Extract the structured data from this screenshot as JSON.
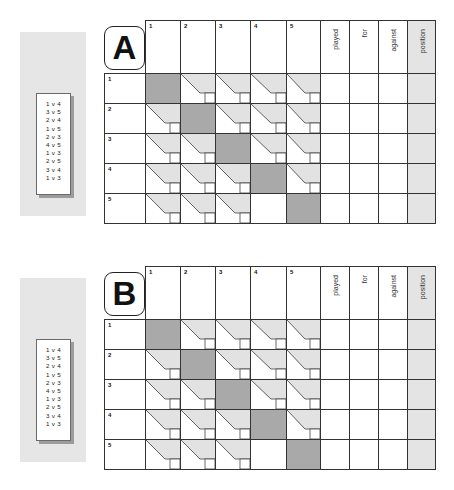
{
  "sheets": [
    {
      "label": "A",
      "fixtures": [
        "1 v 4",
        "3 v 5",
        "2 v 4",
        "1 v 5",
        "2 v 3",
        "4 v 5",
        "1 v 3",
        "2 v 5",
        "3 v 4",
        "1 v 3"
      ],
      "column_numbers": [
        "1",
        "2",
        "3",
        "4",
        "5"
      ],
      "stat_headers": [
        "played",
        "for",
        "against",
        "position"
      ],
      "row_numbers": [
        "1",
        "2",
        "3",
        "4",
        "5"
      ],
      "empty_score_cells": [
        [
          4,
          3
        ]
      ]
    },
    {
      "label": "B",
      "fixtures": [
        "1 v 4",
        "3 v 5",
        "2 v 4",
        "1 v 5",
        "2 v 3",
        "4 v 5",
        "1 v 3",
        "2 v 5",
        "3 v 4",
        "1 v 3"
      ],
      "column_numbers": [
        "1",
        "2",
        "3",
        "4",
        "5"
      ],
      "stat_headers": [
        "played",
        "for",
        "against",
        "position"
      ],
      "row_numbers": [
        "1",
        "2",
        "3",
        "4",
        "5"
      ],
      "empty_score_cells": [
        [
          4,
          3
        ]
      ]
    }
  ],
  "colors": {
    "panel": "#e6e6e6",
    "diagonal_cell": "#a9a9a9",
    "score_wedge": "#e2e2e2",
    "position_column": "#e4e4e4",
    "grid_line": "#333333"
  }
}
